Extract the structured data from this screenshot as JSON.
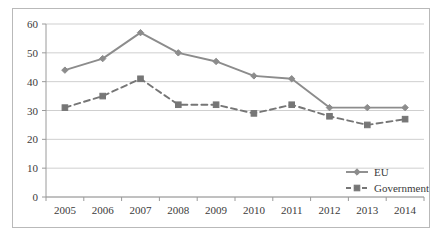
{
  "chart_data": {
    "type": "line",
    "title": "",
    "subtitle": "",
    "xlabel": "",
    "ylabel": "",
    "categories": [
      "2005",
      "2006",
      "2007",
      "2008",
      "2009",
      "2010",
      "2011",
      "2012",
      "2013",
      "2014"
    ],
    "x": [
      2005,
      2006,
      2007,
      2008,
      2009,
      2010,
      2011,
      2012,
      2013,
      2014
    ],
    "series": [
      {
        "name": "EU",
        "values": [
          44,
          48,
          57,
          50,
          47,
          42,
          41,
          31,
          31,
          31
        ],
        "color": "#8c8c8c",
        "line_style": "solid",
        "marker": "diamond"
      },
      {
        "name": "Government",
        "values": [
          31,
          35,
          41,
          32,
          32,
          29,
          32,
          28,
          25,
          27
        ],
        "color": "#767676",
        "line_style": "dashed",
        "marker": "square"
      }
    ],
    "ylim": [
      0,
      60
    ],
    "yticks": [
      0,
      10,
      20,
      30,
      40,
      50,
      60
    ],
    "ytick_labels": [
      "0",
      "10",
      "20",
      "30",
      "40",
      "50",
      "60"
    ],
    "xtick_labels": [
      "2005",
      "2006",
      "2007",
      "2008",
      "2009",
      "2010",
      "2011",
      "2012",
      "2013",
      "2014"
    ],
    "grid": "horizontal",
    "legend_position": "bottom-right",
    "legend_entries": [
      "EU",
      "Government"
    ],
    "gridline_color": "#cfcfcf",
    "axis_color": "#9a9a9a",
    "frame_color": "#b9b9b9",
    "background": "#ffffff"
  }
}
